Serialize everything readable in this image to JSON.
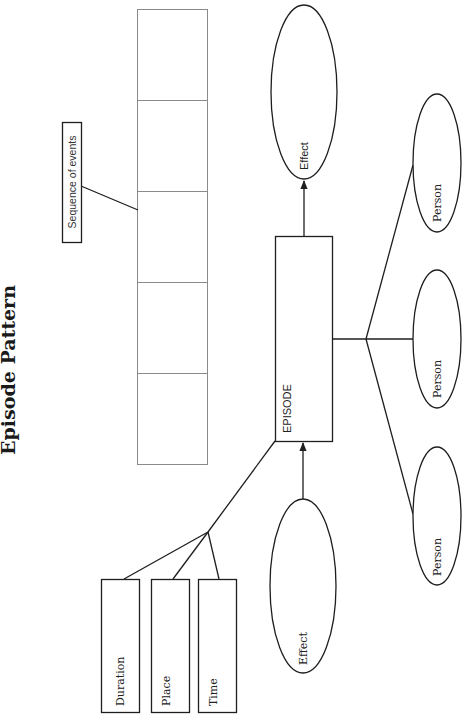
{
  "title": "Episode Pattern",
  "sequence": {
    "label": "Sequence of events",
    "cell_count": 5
  },
  "episode": {
    "label": "EPISODE"
  },
  "effects": [
    {
      "label": "Effect",
      "position": "cause-input"
    },
    {
      "label": "Effect",
      "position": "output"
    }
  ],
  "attributes": [
    {
      "label": "Duration"
    },
    {
      "label": "Place"
    },
    {
      "label": "Time"
    }
  ],
  "persons": [
    {
      "label": "Person"
    },
    {
      "label": "Person"
    },
    {
      "label": "Person"
    }
  ],
  "colors": {
    "line": "#1e1e1e",
    "cell_border": "#8a8a8a",
    "background": "#ffffff"
  }
}
